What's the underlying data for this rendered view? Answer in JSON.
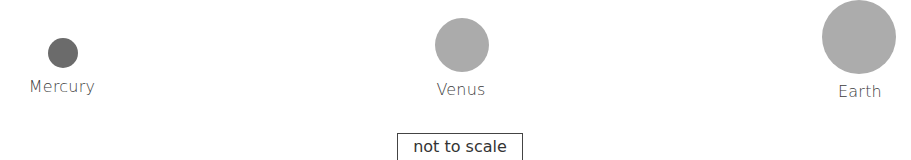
{
  "planets": [
    {
      "name": "Mercury",
      "color": "#6b6b6b",
      "cx": 63,
      "cy": 53,
      "r": 15,
      "label_x": 62,
      "label_y": 79
    },
    {
      "name": "Venus",
      "color": "#ababab",
      "cx": 462,
      "cy": 45,
      "r": 27,
      "label_x": 461,
      "label_y": 82
    },
    {
      "name": "Earth",
      "color": "#acacac",
      "cx": 859,
      "cy": 37,
      "r": 37,
      "label_x": 860,
      "label_y": 84
    }
  ],
  "note": {
    "text": "not to scale"
  }
}
